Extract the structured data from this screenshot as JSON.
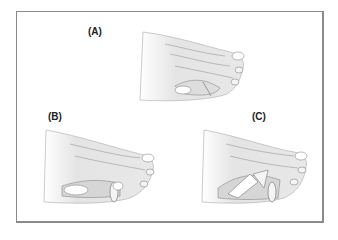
{
  "figure": {
    "panels": [
      {
        "id": "A",
        "label": "(A)"
      },
      {
        "id": "B",
        "label": "(B)"
      },
      {
        "id": "C",
        "label": "(C)"
      }
    ]
  },
  "colors": {
    "border": "#8a8a8a",
    "skin": "#e6e6e6",
    "outline": "#9a9a9a",
    "shadow": "#cfcfcf",
    "background": "#ffffff"
  }
}
